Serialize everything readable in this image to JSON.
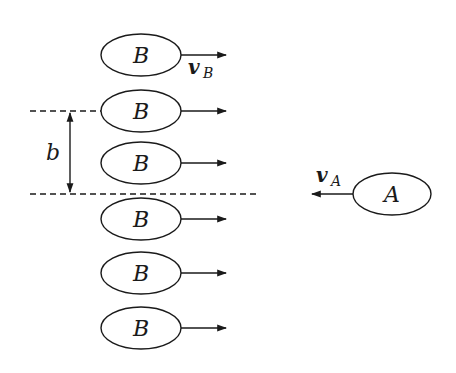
{
  "diagram": {
    "title": "",
    "colors": {
      "stroke": "#1a1a1a",
      "background": "#ffffff"
    },
    "particles_B": [
      {
        "label": "B",
        "cx": 141,
        "cy": 55
      },
      {
        "label": "B",
        "cx": 141,
        "cy": 111
      },
      {
        "label": "B",
        "cx": 141,
        "cy": 163
      },
      {
        "label": "B",
        "cx": 141,
        "cy": 219
      },
      {
        "label": "B",
        "cx": 141,
        "cy": 273
      },
      {
        "label": "B",
        "cx": 141,
        "cy": 328
      }
    ],
    "particle_A": {
      "label": "A",
      "cx": 392,
      "cy": 194
    },
    "velocity_B": {
      "symbol": "v",
      "subscript": "B",
      "direction": "right"
    },
    "velocity_A": {
      "symbol": "v",
      "subscript": "A",
      "direction": "left"
    },
    "impact_parameter": {
      "label": "b"
    }
  }
}
